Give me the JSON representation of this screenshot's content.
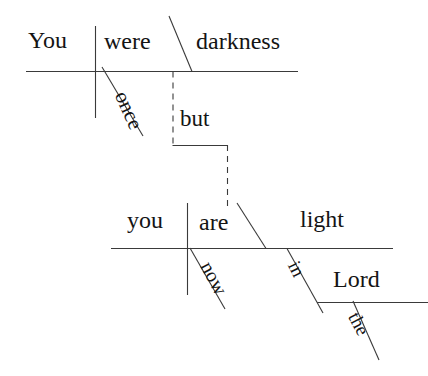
{
  "diagram": {
    "type": "reed-kellogg-sentence-diagram",
    "sentence": "You were once darkness but now you are light in the Lord",
    "line_color": "#3a3a3a",
    "text_color": "#141414",
    "background": "#ffffff",
    "clauses": [
      {
        "name": "first-clause",
        "subject": "You",
        "verb": "were",
        "predicate_nominative": "darkness",
        "modifiers": [
          {
            "word": "once",
            "attaches_to": "were",
            "kind": "adverb"
          }
        ]
      },
      {
        "name": "second-clause",
        "subject": "you",
        "verb": "are",
        "predicate_nominative": "light",
        "modifiers": [
          {
            "word": "now",
            "attaches_to": "are",
            "kind": "adverb"
          },
          {
            "word": "in",
            "attaches_to": "light",
            "kind": "preposition"
          },
          {
            "word": "Lord",
            "attaches_to": "in",
            "kind": "object-of-preposition"
          },
          {
            "word": "the",
            "attaches_to": "Lord",
            "kind": "article"
          }
        ]
      }
    ],
    "conjunction": {
      "word": "but",
      "kind": "coordinating-conjunction",
      "joins": [
        "first-clause",
        "second-clause"
      ]
    },
    "words": {
      "you_top": "You",
      "were": "were",
      "darkness": "darkness",
      "once": "once",
      "but": "but",
      "you_bottom": "you",
      "are": "are",
      "light": "light",
      "now": "now",
      "in": "in",
      "lord": "Lord",
      "the": "the"
    }
  }
}
